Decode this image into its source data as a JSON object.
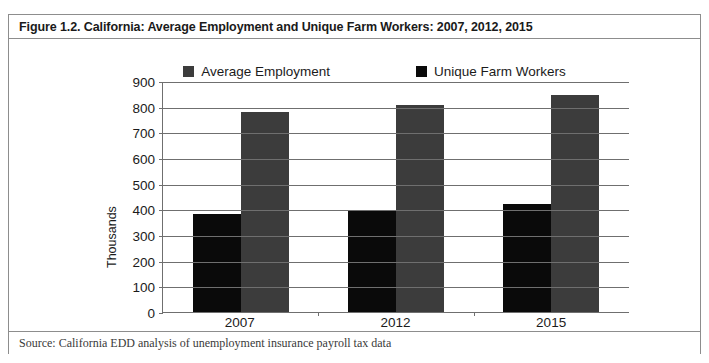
{
  "figure": {
    "title": "Figure 1.2. California: Average Employment and Unique Farm Workers: 2007, 2012, 2015",
    "source": "Source: California EDD analysis of unemployment insurance payroll tax data"
  },
  "colors": {
    "series_average_employment": "#3c3c3c",
    "series_unique_farm_workers": "#0a0a0a",
    "axis": "#6f6f6f",
    "frame_border": "#8d8d8d",
    "text": "#1b1b1b"
  },
  "chart_data": {
    "type": "bar",
    "title": "Figure 1.2. California: Average Employment and Unique Farm Workers: 2007, 2012, 2015",
    "subtitle": "",
    "xlabel": "",
    "ylabel": "Thousands",
    "categories": [
      "2007",
      "2012",
      "2015"
    ],
    "series": [
      {
        "name": "Average Employment",
        "color": "#3c3c3c",
        "values": [
          780,
          805,
          845
        ]
      },
      {
        "name": "Unique Farm Workers",
        "color": "#0a0a0a",
        "values": [
          380,
          395,
          420
        ]
      }
    ],
    "bar_draw_order": [
      "Unique Farm Workers",
      "Average Employment"
    ],
    "ylim": [
      0,
      900
    ],
    "ytick_step": 100,
    "yticks": [
      0,
      100,
      200,
      300,
      400,
      500,
      600,
      700,
      800,
      900
    ],
    "ytick_labels": [
      "0",
      "100",
      "200",
      "300",
      "400",
      "500",
      "600",
      "700",
      "800",
      "900"
    ],
    "grid": "horizontal",
    "legend_position": "top-center",
    "annotations": []
  }
}
